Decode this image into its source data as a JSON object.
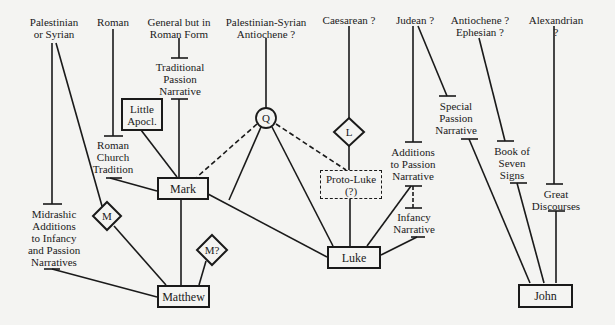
{
  "diagram": {
    "type": "source-origin-diagram",
    "provenance_labels": [
      {
        "id": "pal-syr",
        "text": "Palestinian\nor Syrian"
      },
      {
        "id": "roman",
        "text": "Roman"
      },
      {
        "id": "general-roman",
        "text": "General but in\nRoman Form"
      },
      {
        "id": "pal-syr-ant",
        "text": "Palestinian-Syrian\nAntiochene ?"
      },
      {
        "id": "caesarean",
        "text": "Caesarean ?"
      },
      {
        "id": "judean",
        "text": "Judean ?"
      },
      {
        "id": "ant-eph",
        "text": "Antiochene ?\nEphesian ?"
      },
      {
        "id": "alexandrian",
        "text": "Alexandrian ?"
      }
    ],
    "tradition_labels": [
      {
        "id": "trad-passion",
        "text": "Traditional\nPassion\nNarrative"
      },
      {
        "id": "roman-church",
        "text": "Roman\nChurch\nTradition"
      },
      {
        "id": "midrashic",
        "text": "Midrashic\nAdditions\nto Infancy\nand Passion\nNarratives"
      },
      {
        "id": "additions-passion",
        "text": "Additions\nto Passion\nNarrative"
      },
      {
        "id": "infancy",
        "text": "Infancy\nNarrative"
      },
      {
        "id": "special-passion",
        "text": "Special\nPassion\nNarrative"
      },
      {
        "id": "seven-signs",
        "text": "Book of\nSeven\nSigns"
      },
      {
        "id": "great-discourses",
        "text": "Great\nDiscourses"
      }
    ],
    "boxes": [
      {
        "id": "little-apocl",
        "text": "Little\nApocl."
      },
      {
        "id": "mark",
        "text": "Mark"
      },
      {
        "id": "matthew",
        "text": "Matthew"
      },
      {
        "id": "luke",
        "text": "Luke"
      },
      {
        "id": "john",
        "text": "John"
      },
      {
        "id": "proto-luke",
        "text": "Proto-Luke\n(?)",
        "style": "dashed"
      }
    ],
    "sources": [
      {
        "id": "Q",
        "text": "Q",
        "shape": "circle"
      },
      {
        "id": "L",
        "text": "L",
        "shape": "diamond"
      },
      {
        "id": "M",
        "text": "M",
        "shape": "diamond"
      },
      {
        "id": "M?",
        "text": "M?",
        "shape": "diamond"
      }
    ],
    "edges": [
      {
        "from": "Palestinian or Syrian",
        "to": "Midrashic Additions"
      },
      {
        "from": "Palestinian or Syrian",
        "to": "M"
      },
      {
        "from": "Roman",
        "to": "Roman Church Tradition"
      },
      {
        "from": "General but in Roman Form",
        "to": "Traditional Passion Narrative"
      },
      {
        "from": "Traditional Passion Narrative",
        "to": "Mark"
      },
      {
        "from": "Little Apocl.",
        "to": "Mark"
      },
      {
        "from": "Roman Church Tradition",
        "to": "Mark"
      },
      {
        "from": "Palestinian-Syrian Antiochene",
        "to": "Q"
      },
      {
        "from": "Q",
        "to": "Mark",
        "style": "dashed"
      },
      {
        "from": "Q",
        "to": "Proto-Luke",
        "style": "dashed"
      },
      {
        "from": "Q",
        "to": "Matthew"
      },
      {
        "from": "Q",
        "to": "Luke"
      },
      {
        "from": "Caesarean",
        "to": "L"
      },
      {
        "from": "L",
        "to": "Proto-Luke"
      },
      {
        "from": "Proto-Luke",
        "to": "Luke"
      },
      {
        "from": "Judean",
        "to": "Additions to Passion Narrative"
      },
      {
        "from": "Judean",
        "to": "Special Passion Narrative"
      },
      {
        "from": "Additions to Passion Narrative",
        "to": "Infancy Narrative",
        "style": "dashed"
      },
      {
        "from": "Additions to Passion Narrative",
        "to": "Luke"
      },
      {
        "from": "Infancy Narrative",
        "to": "Luke"
      },
      {
        "from": "Mark",
        "to": "Matthew"
      },
      {
        "from": "Mark",
        "to": "Luke"
      },
      {
        "from": "M",
        "to": "Matthew"
      },
      {
        "from": "M?",
        "to": "Matthew"
      },
      {
        "from": "Midrashic Additions",
        "to": "Matthew"
      },
      {
        "from": "Antiochene Ephesian",
        "to": "Book of Seven Signs"
      },
      {
        "from": "Alexandrian",
        "to": "Great Discourses"
      },
      {
        "from": "Special Passion Narrative",
        "to": "John"
      },
      {
        "from": "Book of Seven Signs",
        "to": "John"
      },
      {
        "from": "Great Discourses",
        "to": "John"
      }
    ]
  }
}
